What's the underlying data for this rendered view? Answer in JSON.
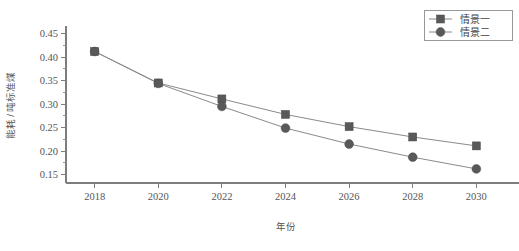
{
  "chart_data": {
    "type": "line",
    "title": "",
    "xlabel": "年份",
    "ylabel": "能耗 / 吨标准煤",
    "x": [
      2018,
      2020,
      2022,
      2024,
      2026,
      2028,
      2030
    ],
    "xtick_labels": [
      "2018",
      "2020",
      "2022",
      "2024",
      "2026",
      "2028",
      "2030"
    ],
    "ytick_labels": [
      "0.15",
      "0.20",
      "0.25",
      "0.30",
      "0.35",
      "0.40",
      "0.45"
    ],
    "ytick_values": [
      0.15,
      0.2,
      0.25,
      0.3,
      0.35,
      0.4,
      0.45
    ],
    "ylim": [
      0.132,
      0.462
    ],
    "xlim": [
      2017.1,
      2030.9
    ],
    "grid": false,
    "minor_ticks_y": true,
    "legend_position": "top-right",
    "series": [
      {
        "name": "情景一",
        "marker": "square",
        "color": "#595959",
        "line_color": "#8a8a8a",
        "values": [
          0.412,
          0.345,
          0.311,
          0.278,
          0.252,
          0.23,
          0.211
        ]
      },
      {
        "name": "情景二",
        "marker": "circle",
        "color": "#595959",
        "line_color": "#8a8a8a",
        "values": [
          0.412,
          0.344,
          0.295,
          0.249,
          0.215,
          0.187,
          0.162
        ]
      }
    ]
  },
  "legend": {
    "entries": [
      {
        "label": "情景一",
        "marker": "square-marker-icon"
      },
      {
        "label": "情景二",
        "marker": "circle-marker-icon"
      }
    ]
  },
  "axes": {
    "x_title": "年份",
    "y_title": "能耗 / 吨标准煤"
  },
  "colors": {
    "marker": "#595959",
    "line": "#8a8a8a",
    "axis": "#7d7d7d",
    "text": "#555555",
    "background": "#ffffff"
  }
}
